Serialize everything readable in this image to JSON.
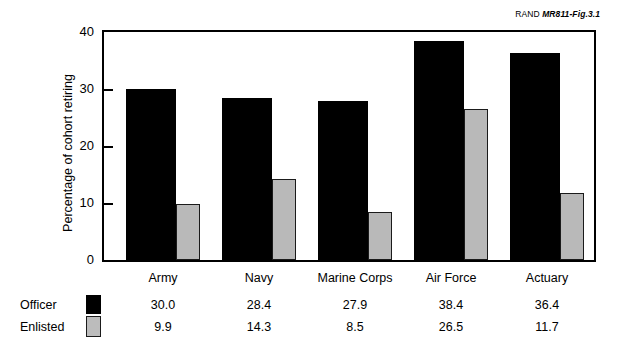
{
  "source_tag": {
    "brand": "RAND ",
    "reference": "MR811-Fig.3.1"
  },
  "chart_data": {
    "type": "bar",
    "title": "",
    "subtitle": "",
    "xlabel": "",
    "ylabel": "Percentage of cohort retiring",
    "ylim": [
      0,
      40
    ],
    "yticks": [
      "0",
      "10",
      "20",
      "30",
      "40"
    ],
    "grid": false,
    "legend_position": "bottom-table",
    "categories": [
      "Army",
      "Navy",
      "Marine Corps",
      "Air Force",
      "Actuary"
    ],
    "series": [
      {
        "name": "Officer",
        "color": "#000000",
        "values": [
          30.0,
          28.4,
          27.9,
          38.4,
          36.4
        ],
        "labels": [
          "30.0",
          "28.4",
          "27.9",
          "38.4",
          "36.4"
        ]
      },
      {
        "name": "Enlisted",
        "color": "#b9b9b9",
        "values": [
          9.9,
          14.3,
          8.5,
          26.5,
          11.7
        ],
        "labels": [
          "9.9",
          "14.3",
          "8.5",
          "26.5",
          "11.7"
        ]
      }
    ]
  }
}
